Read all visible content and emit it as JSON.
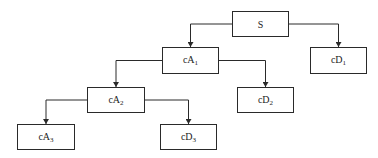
{
  "diagram": {
    "type": "tree",
    "nodes": [
      {
        "id": "S",
        "base": "S",
        "sub": "",
        "x": 232,
        "y": 11,
        "w": 57,
        "h": 26
      },
      {
        "id": "cA1",
        "base": "cA",
        "sub": "1",
        "x": 162,
        "y": 47,
        "w": 57,
        "h": 27
      },
      {
        "id": "cD1",
        "base": "cD",
        "sub": "1",
        "x": 310,
        "y": 47,
        "w": 57,
        "h": 27
      },
      {
        "id": "cA2",
        "base": "cA",
        "sub": "2",
        "x": 87,
        "y": 87,
        "w": 58,
        "h": 26
      },
      {
        "id": "cD2",
        "base": "cD",
        "sub": "2",
        "x": 237,
        "y": 87,
        "w": 57,
        "h": 26
      },
      {
        "id": "cA3",
        "base": "cA",
        "sub": "3",
        "x": 17,
        "y": 124,
        "w": 58,
        "h": 26
      },
      {
        "id": "cD3",
        "base": "cD",
        "sub": "3",
        "x": 160,
        "y": 124,
        "w": 57,
        "h": 26
      }
    ],
    "edges": [
      {
        "from": "S",
        "to": "cA1"
      },
      {
        "from": "S",
        "to": "cD1"
      },
      {
        "from": "cA1",
        "to": "cA2"
      },
      {
        "from": "cA1",
        "to": "cD2"
      },
      {
        "from": "cA2",
        "to": "cA3"
      },
      {
        "from": "cA2",
        "to": "cD3"
      }
    ],
    "colors": {
      "line": "#2a2a2a",
      "box_border": "#2a2a2a",
      "background": "#ffffff"
    }
  }
}
